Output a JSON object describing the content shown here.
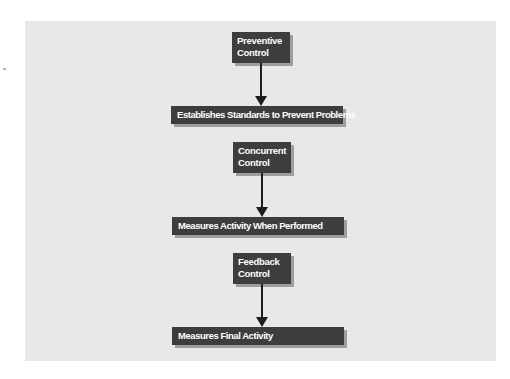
{
  "diagram": {
    "type": "flowchart",
    "colors": {
      "panel": "#e8e8e8",
      "box": "#3d3d3d",
      "box_text": "#ffffff",
      "shadow": "#9e9e9e",
      "arrow": "#1e1e1e"
    },
    "stages": [
      {
        "control": {
          "line1": "Preventive",
          "line2": "Control"
        },
        "description": "Establishes Standards to Prevent Problems"
      },
      {
        "control": {
          "line1": "Concurrent",
          "line2": "Control"
        },
        "description": "Measures Activity When Performed"
      },
      {
        "control": {
          "line1": "Feedback",
          "line2": "Control"
        },
        "description": "Measures Final Activity"
      }
    ]
  }
}
